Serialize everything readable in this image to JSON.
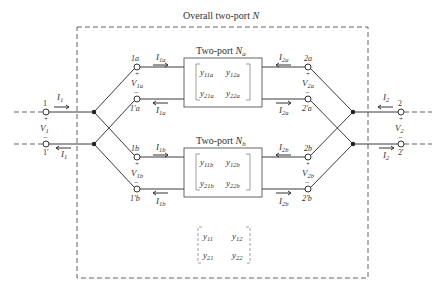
{
  "title": "Overall two-port N",
  "title_main": "Overall two-port ",
  "title_var": "N",
  "subnetworks": [
    {
      "id": "a",
      "title_main": "Two-port ",
      "title_var": "N",
      "title_sub": "a",
      "matrix": [
        [
          "y11a",
          "y12a"
        ],
        [
          "y21a",
          "y22a"
        ]
      ],
      "matrix_labels": {
        "m11": "y",
        "m11s": "11a",
        "m12": "y",
        "m12s": "12a",
        "m21": "y",
        "m21s": "21a",
        "m22": "y",
        "m22s": "22a"
      },
      "nodes": {
        "in_top": "1a",
        "in_bot": "1′a",
        "out_top": "2a",
        "out_bot": "2′a"
      },
      "currents": {
        "in": "I1a",
        "out": "I2a"
      },
      "voltages": {
        "in": "V1a",
        "out": "V2a"
      }
    },
    {
      "id": "b",
      "title_main": "Two-port ",
      "title_var": "N",
      "title_sub": "b",
      "matrix": [
        [
          "y11b",
          "y12b"
        ],
        [
          "y21b",
          "y22b"
        ]
      ],
      "matrix_labels": {
        "m11": "y",
        "m11s": "11b",
        "m12": "y",
        "m12s": "12b",
        "m21": "y",
        "m21s": "21b",
        "m22": "y",
        "m22s": "22b"
      },
      "nodes": {
        "in_top": "1b",
        "in_bot": "1′b",
        "out_top": "2b",
        "out_bot": "2′b"
      },
      "currents": {
        "in": "I1b",
        "out": "I2b"
      },
      "voltages": {
        "in": "V1b",
        "out": "V2b"
      }
    }
  ],
  "ports": {
    "port1": {
      "top": "1",
      "bot": "1′",
      "current": "I",
      "current_sub": "1",
      "voltage": "V",
      "voltage_sub": "1"
    },
    "port2": {
      "top": "2",
      "bot": "2′",
      "current": "I",
      "current_sub": "2",
      "voltage": "V",
      "voltage_sub": "2"
    }
  },
  "overall_matrix": {
    "m11": "y",
    "m11s": "11",
    "m12": "y",
    "m12s": "12",
    "m21": "y",
    "m21s": "21",
    "m22": "y",
    "m22s": "22"
  },
  "signs": {
    "plus": "+",
    "minus": "−"
  },
  "text": {
    "I": "I",
    "V": "V",
    "s1a": "1a",
    "s2a": "2a",
    "s1b": "1b",
    "s2b": "2b",
    "n1a": "1a",
    "n1pa": "1′a",
    "n2a": "2a",
    "n2pa": "2′a",
    "n1b": "1b",
    "n1pb": "1′b",
    "n2b": "2b",
    "n2pb": "2′b"
  }
}
